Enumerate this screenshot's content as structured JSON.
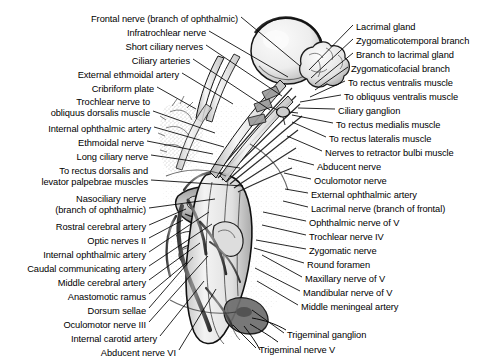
{
  "figure": {
    "kind": "anatomical-illustration",
    "width": 495,
    "height": 364,
    "background": "#ffffff",
    "ink": "#000000"
  },
  "labels_left": [
    {
      "id": "frontal-nerve",
      "lines": [
        "Frontal nerve (branch of ophthalmic)"
      ],
      "x": 238,
      "y": 14,
      "lx": 241,
      "ly": 17,
      "tx": 300,
      "ty": 66
    },
    {
      "id": "infratrochlear-nerve",
      "lines": [
        "Infratrochlear nerve"
      ],
      "x": 206,
      "y": 28,
      "lx": 209,
      "ly": 31,
      "tx": 288,
      "ty": 77
    },
    {
      "id": "short-ciliary-nerves",
      "lines": [
        "Short ciliary nerves"
      ],
      "x": 203,
      "y": 42,
      "lx": 206,
      "ly": 45,
      "tx": 282,
      "ty": 96
    },
    {
      "id": "ciliary-arteries",
      "lines": [
        "Ciliary arteries"
      ],
      "x": 190,
      "y": 56,
      "lx": 193,
      "ly": 59,
      "tx": 270,
      "ty": 110
    },
    {
      "id": "external-ethmoidal-artery",
      "lines": [
        "External ethmoidal artery"
      ],
      "x": 179,
      "y": 70,
      "lx": 182,
      "ly": 73,
      "tx": 233,
      "ty": 104
    },
    {
      "id": "cribriform-plate",
      "lines": [
        "Cribriform plate"
      ],
      "x": 154,
      "y": 84,
      "lx": 157,
      "ly": 87,
      "tx": 196,
      "ty": 109
    },
    {
      "id": "trochlear-nerve-to-obliquus-dorsalis",
      "lines": [
        "Trochlear nerve to",
        "obliquus dorsalis muscle"
      ],
      "x": 150,
      "y": 97,
      "lx": 153,
      "ly": 111,
      "tx": 215,
      "ty": 133
    },
    {
      "id": "internal-ophthalmic-artery-upper",
      "lines": [
        "Internal ophthalmic artery"
      ],
      "x": 151,
      "y": 124,
      "lx": 154,
      "ly": 127,
      "tx": 224,
      "ty": 147
    },
    {
      "id": "ethmoidal-nerve",
      "lines": [
        "Ethmoidal nerve"
      ],
      "x": 144,
      "y": 138,
      "lx": 147,
      "ly": 141,
      "tx": 213,
      "ty": 154
    },
    {
      "id": "long-ciliary-nerve",
      "lines": [
        "Long ciliary nerve"
      ],
      "x": 148,
      "y": 152,
      "lx": 151,
      "ly": 155,
      "tx": 240,
      "ty": 168
    },
    {
      "id": "to-rectus-dorsalis-and-levator-palpebrae",
      "lines": [
        "To rectus dorsalis and",
        "levator palpebrae muscles"
      ],
      "x": 148,
      "y": 166,
      "lx": 151,
      "ly": 180,
      "tx": 243,
      "ty": 186
    },
    {
      "id": "nasociliary-nerve",
      "lines": [
        "Nasociliary nerve",
        "(branch of ophthalmic)"
      ],
      "x": 146,
      "y": 194,
      "lx": 149,
      "ly": 208,
      "tx": 215,
      "ty": 199
    },
    {
      "id": "rostral-cerebral-artery",
      "lines": [
        "Rostral cerebral artery"
      ],
      "x": 146,
      "y": 222,
      "lx": 149,
      "ly": 225,
      "tx": 186,
      "ty": 209
    },
    {
      "id": "optic-nerves-ii",
      "lines": [
        "Optic nerves II"
      ],
      "x": 146,
      "y": 236,
      "lx": 149,
      "ly": 238,
      "tx": 183,
      "ty": 220
    },
    {
      "id": "internal-ophthalmic-artery-lower",
      "lines": [
        "Internal ophthalmic artery"
      ],
      "x": 146,
      "y": 250,
      "lx": 149,
      "ly": 252,
      "tx": 209,
      "ty": 212
    },
    {
      "id": "caudal-communicating-artery",
      "lines": [
        "Caudal communicating artery"
      ],
      "x": 146,
      "y": 264,
      "lx": 149,
      "ly": 266,
      "tx": 212,
      "ty": 224
    },
    {
      "id": "middle-cerebral-artery",
      "lines": [
        "Middle cerebral artery"
      ],
      "x": 146,
      "y": 278,
      "lx": 149,
      "ly": 280,
      "tx": 200,
      "ty": 243
    },
    {
      "id": "anastomotic-ramus",
      "lines": [
        "Anastomotic ramus"
      ],
      "x": 146,
      "y": 292,
      "lx": 149,
      "ly": 294,
      "tx": 186,
      "ty": 263
    },
    {
      "id": "dorsum-sellae",
      "lines": [
        "Dorsum sellae"
      ],
      "x": 146,
      "y": 306,
      "lx": 149,
      "ly": 308,
      "tx": 193,
      "ty": 257
    },
    {
      "id": "oculomotor-nerve-iii",
      "lines": [
        "Oculomotor nerve III"
      ],
      "x": 146,
      "y": 320,
      "lx": 149,
      "ly": 322,
      "tx": 208,
      "ty": 256
    },
    {
      "id": "internal-carotid-artery",
      "lines": [
        "Internal carotid artery"
      ],
      "x": 157,
      "y": 334,
      "lx": 160,
      "ly": 336,
      "tx": 204,
      "ty": 281
    },
    {
      "id": "abducent-nerve-vi",
      "lines": [
        "Abducent nerve VI"
      ],
      "x": 176,
      "y": 348,
      "lx": 179,
      "ly": 350,
      "tx": 216,
      "ty": 289
    }
  ],
  "labels_right": [
    {
      "id": "lacrimal-gland",
      "lines": [
        "Lacrimal gland"
      ],
      "x": 356,
      "y": 22,
      "lx": 353,
      "ly": 25,
      "tx": 309,
      "ty": 70
    },
    {
      "id": "zygomaticotemporal-branch",
      "lines": [
        "Zygomaticotemporal branch"
      ],
      "x": 356,
      "y": 36,
      "lx": 353,
      "ly": 39,
      "tx": 311,
      "ty": 78
    },
    {
      "id": "branch-to-lacrimal-gland",
      "lines": [
        "Branch to lacrimal gland"
      ],
      "x": 356,
      "y": 50,
      "lx": 353,
      "ly": 53,
      "tx": 315,
      "ty": 84
    },
    {
      "id": "zygomaticofacial-branch",
      "lines": [
        "Zygomaticofacial branch"
      ],
      "x": 351,
      "y": 64,
      "lx": 348,
      "ly": 67,
      "tx": 315,
      "ty": 90
    },
    {
      "id": "to-rectus-ventralis-muscle",
      "lines": [
        "To rectus ventralis muscle"
      ],
      "x": 348,
      "y": 78,
      "lx": 345,
      "ly": 81,
      "tx": 310,
      "ty": 97
    },
    {
      "id": "to-obliquus-ventralis-muscle",
      "lines": [
        "To obliquus ventralis muscle"
      ],
      "x": 344,
      "y": 92,
      "lx": 341,
      "ly": 95,
      "tx": 300,
      "ty": 102
    },
    {
      "id": "ciliary-ganglion",
      "lines": [
        "Ciliary ganglion"
      ],
      "x": 338,
      "y": 106,
      "lx": 335,
      "ly": 109,
      "tx": 298,
      "ty": 108
    },
    {
      "id": "to-rectus-medialis-muscle",
      "lines": [
        "To rectus medialis muscle"
      ],
      "x": 336,
      "y": 120,
      "lx": 333,
      "ly": 123,
      "tx": 292,
      "ty": 115
    },
    {
      "id": "to-rectus-lateralis-muscle",
      "lines": [
        "To rectus lateralis muscle"
      ],
      "x": 329,
      "y": 134,
      "lx": 326,
      "ly": 137,
      "tx": 292,
      "ty": 122
    },
    {
      "id": "nerves-to-retractor-bulbi-muscle",
      "lines": [
        "Nerves to retractor bulbi muscle"
      ],
      "x": 325,
      "y": 148,
      "lx": 322,
      "ly": 151,
      "tx": 287,
      "ty": 136
    },
    {
      "id": "abducent-nerve",
      "lines": [
        "Abducent nerve"
      ],
      "x": 317,
      "y": 162,
      "lx": 314,
      "ly": 165,
      "tx": 288,
      "ty": 158
    },
    {
      "id": "oculomotor-nerve",
      "lines": [
        "Oculomotor nerve"
      ],
      "x": 314,
      "y": 176,
      "lx": 311,
      "ly": 179,
      "tx": 284,
      "ty": 173
    },
    {
      "id": "external-ophthalmic-artery",
      "lines": [
        "External ophthalmic artery"
      ],
      "x": 311,
      "y": 190,
      "lx": 308,
      "ly": 193,
      "tx": 285,
      "ty": 189
    },
    {
      "id": "lacrimal-nerve",
      "lines": [
        "Lacrimal nerve (branch of frontal)"
      ],
      "x": 311,
      "y": 204,
      "lx": 308,
      "ly": 207,
      "tx": 283,
      "ty": 201
    },
    {
      "id": "ophthalmic-nerve-of-v",
      "lines": [
        "Ophthalmic nerve of V"
      ],
      "x": 309,
      "y": 218,
      "lx": 306,
      "ly": 221,
      "tx": 263,
      "ty": 212
    },
    {
      "id": "trochlear-nerve-iv",
      "lines": [
        "Trochlear nerve IV"
      ],
      "x": 309,
      "y": 232,
      "lx": 306,
      "ly": 235,
      "tx": 262,
      "ty": 225
    },
    {
      "id": "zygomatic-nerve",
      "lines": [
        "Zygomatic nerve"
      ],
      "x": 309,
      "y": 246,
      "lx": 306,
      "ly": 249,
      "tx": 256,
      "ty": 240
    },
    {
      "id": "round-foramen",
      "lines": [
        "Round foramen"
      ],
      "x": 307,
      "y": 260,
      "lx": 304,
      "ly": 263,
      "tx": 254,
      "ty": 248
    },
    {
      "id": "maxillary-nerve-of-v",
      "lines": [
        "Maxillary nerve of V"
      ],
      "x": 305,
      "y": 274,
      "lx": 302,
      "ly": 277,
      "tx": 262,
      "ty": 255
    },
    {
      "id": "mandibular-nerve-of-v",
      "lines": [
        "Mandibular nerve of V"
      ],
      "x": 303,
      "y": 288,
      "lx": 300,
      "ly": 291,
      "tx": 255,
      "ty": 268
    },
    {
      "id": "middle-meningeal-artery",
      "lines": [
        "Middle meningeal artery"
      ],
      "x": 301,
      "y": 302,
      "lx": 298,
      "ly": 305,
      "tx": 257,
      "ty": 281
    },
    {
      "id": "trigeminal-ganglion",
      "lines": [
        "Trigeminal ganglion"
      ],
      "x": 287,
      "y": 330,
      "lx": 284,
      "ly": 333,
      "tx": 252,
      "ty": 310
    },
    {
      "id": "trigeminal-nerve-v",
      "lines": [
        "Trigeminal nerve V"
      ],
      "x": 259,
      "y": 345,
      "lx": 256,
      "ly": 348,
      "tx": 233,
      "ty": 325
    }
  ]
}
